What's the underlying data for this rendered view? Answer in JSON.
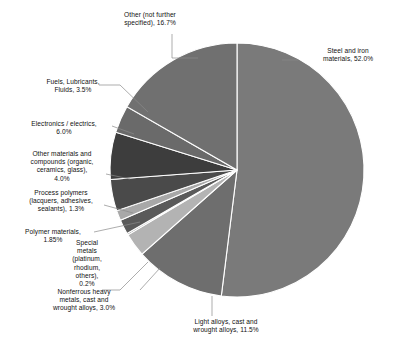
{
  "chart_data": {
    "type": "pie",
    "title": "",
    "subtitle": "",
    "xlabel": "",
    "ylabel": "",
    "legend_position": "none",
    "grid": false,
    "units": "percent",
    "start_angle_deg": 0,
    "direction": "clockwise",
    "center": {
      "x": 237,
      "y": 170
    },
    "radius": 127,
    "separator_color": "#ffffff",
    "background_color": "#ffffff",
    "labels": [
      "Steel and iron materials",
      "Light alloys, cast and wrought alloys",
      "Nonferrous heavy metals, cast and wrought alloys",
      "Special metals (platinum, rhodium, others)",
      "Polymer materials",
      "Process polymers (lacquers, adhesives, sealants)",
      "Other materials and compounds (organic, ceramics, glass)",
      "Electronics / electrics",
      "Fuels, Lubricants, Fluids",
      "Other (not further specified)"
    ],
    "values": [
      52.0,
      11.5,
      3.0,
      0.2,
      1.85,
      1.3,
      4.0,
      6.0,
      3.5,
      16.7
    ],
    "colors": [
      "#7a7a7a",
      "#6e6e6e",
      "#b3b3b3",
      "#8c8c8c",
      "#5a5a5a",
      "#a8a8a8",
      "#4a4a4a",
      "#3d3d3d",
      "#6a6a6a",
      "#707070"
    ],
    "slices": [
      {
        "id": "steel-and-iron",
        "label": "Steel and iron materials",
        "value": 52.0,
        "display": "Steel and iron materials, 52.0%",
        "color": "#7a7a7a"
      },
      {
        "id": "light-alloys",
        "label": "Light alloys, cast and wrought alloys",
        "value": 11.5,
        "display": "Light alloys, cast and wrought alloys, 11.5%",
        "color": "#6e6e6e"
      },
      {
        "id": "nonferrous-heavy-metals",
        "label": "Nonferrous heavy metals, cast and wrought alloys",
        "value": 3.0,
        "display": "Nonferrous heavy metals, cast and wrought alloys, 3.0%",
        "color": "#b3b3b3"
      },
      {
        "id": "special-metals",
        "label": "Special metals (platinum, rhodium, others)",
        "value": 0.2,
        "display": "Special metals (platinum, rhodium, others), 0.2%",
        "color": "#8c8c8c"
      },
      {
        "id": "polymer-materials",
        "label": "Polymer materials",
        "value": 1.85,
        "display": "Polymer materials, 1.85%",
        "color": "#5a5a5a"
      },
      {
        "id": "process-polymers",
        "label": "Process polymers (lacquers, adhesives, sealants)",
        "value": 1.3,
        "display": "Process polymers (lacquers, adhesives, sealants), 1.3%",
        "color": "#a8a8a8"
      },
      {
        "id": "other-materials-compounds",
        "label": "Other materials and compounds (organic, ceramics, glass)",
        "value": 4.0,
        "display": "Other materials and compounds (organic, ceramics, glass), 4.0%",
        "color": "#4a4a4a"
      },
      {
        "id": "electronics-electrics",
        "label": "Electronics / electrics",
        "value": 6.0,
        "display": "Electronics / electrics, 6.0%",
        "color": "#3d3d3d"
      },
      {
        "id": "fuels-lubricants-fluids",
        "label": "Fuels, Lubricants, Fluids",
        "value": 3.5,
        "display": "Fuels, Lubricants, Fluids, 3.5%",
        "color": "#6a6a6a"
      },
      {
        "id": "other-not-further-specified",
        "label": "Other (not further specified)",
        "value": 16.7,
        "display": "Other (not further specified), 16.7%",
        "color": "#707070"
      }
    ]
  },
  "callout_labels": {
    "steel": "Steel and iron\nmaterials, 52.0%",
    "light_alloys": "Light alloys, cast and\nwrought alloys, 11.5%",
    "nonferrous": "Nonferrous heavy\nmetals, cast and\nwrought alloys, 3.0%",
    "special_metals": "Special\nmetals\n(platinum,\nrhodium,\nothers),\n0.2%",
    "polymer_materials": "Polymer materials,\n1.85%",
    "process_polymers": "Process polymers\n(lacquers, adhesives,\nsealants), 1.3%",
    "other_materials": "Other materials and\ncompounds (organic,\nceramics, glass),\n4.0%",
    "electronics": "Electronics / electrics,\n6.0%",
    "fuels": "Fuels, Lubricants,\nFluids, 3.5%",
    "other_ns": "Other (not further\nspecified), 16.7%"
  }
}
